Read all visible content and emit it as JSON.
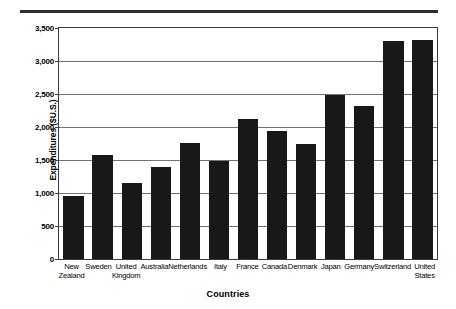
{
  "figure": {
    "top_rule": "",
    "clipped_title": "",
    "xlabel": "Countries",
    "ylabel": "Expenditures ($U.S.)",
    "bar_color": "#17181a",
    "grid_color": "#6f7276",
    "axis_color": "#3a3d40"
  },
  "chart_data": {
    "type": "bar",
    "title": "",
    "xlabel": "Countries",
    "ylabel": "Expenditures ($U.S.)",
    "ylim": [
      0,
      3500
    ],
    "yticks": [
      0,
      500,
      1000,
      1500,
      2000,
      2500,
      3000,
      3500
    ],
    "ytick_labels": [
      "0",
      "500",
      "1,000",
      "1,500",
      "2,000",
      "2,500",
      "3,000",
      "3,500"
    ],
    "grid": true,
    "legend": false,
    "categories": [
      "New Zealand",
      "Sweden",
      "United Kingdom",
      "Australia",
      "Netherlands",
      "Italy",
      "France",
      "Canada",
      "Denmark",
      "Japan",
      "Germany",
      "Switzerland",
      "United States"
    ],
    "category_lines": [
      [
        "New",
        "Zealand"
      ],
      [
        "Sweden",
        ""
      ],
      [
        "United",
        "Kingdom"
      ],
      [
        "Australia",
        ""
      ],
      [
        "Netherlands",
        ""
      ],
      [
        "Italy",
        ""
      ],
      [
        "France",
        ""
      ],
      [
        "Canada",
        ""
      ],
      [
        "Denmark",
        ""
      ],
      [
        "Japan",
        ""
      ],
      [
        "Germany",
        ""
      ],
      [
        "Switzerland",
        ""
      ],
      [
        "United",
        "States"
      ]
    ],
    "values": [
      960,
      1580,
      1150,
      1390,
      1760,
      1490,
      2120,
      1940,
      1745,
      2485,
      2320,
      3300,
      3320
    ]
  }
}
